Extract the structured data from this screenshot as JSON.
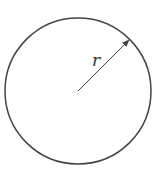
{
  "diagram": {
    "type": "circle-radius",
    "circle": {
      "cx": 78,
      "cy": 91,
      "r": 73,
      "stroke": "#444444"
    },
    "radius_arrow": {
      "x1": 78,
      "y1": 91,
      "x2": 129,
      "y2": 40,
      "color": "#444444"
    },
    "label": {
      "text": "r",
      "x": 92,
      "y": 66
    }
  }
}
